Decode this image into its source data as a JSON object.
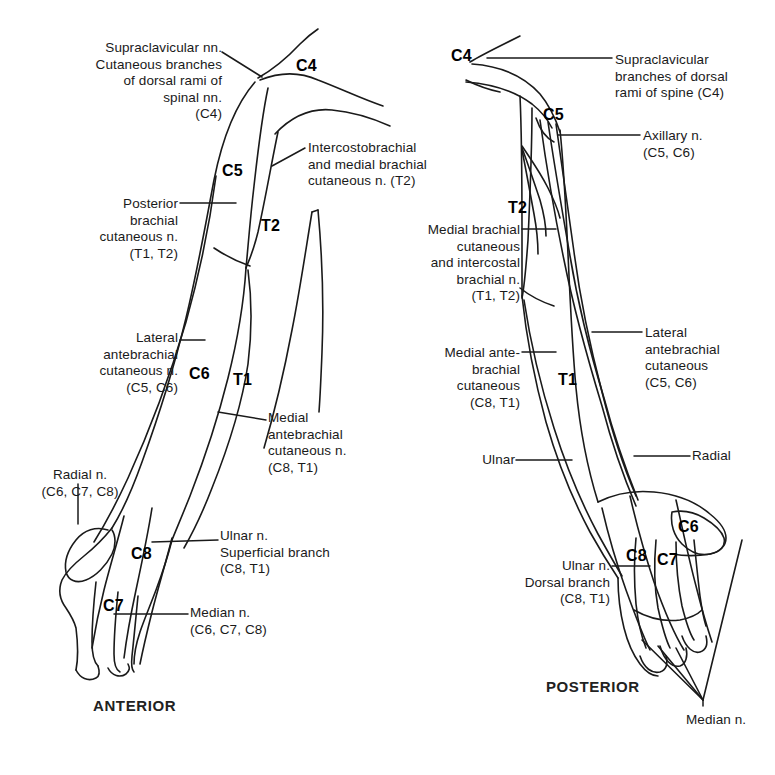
{
  "figure": {
    "background_color": "#ffffff",
    "line_color": "#1a1a1a",
    "text_color": "#1a1a1a"
  },
  "anterior": {
    "view_label": "ANTERIOR",
    "dermatomes": [
      {
        "name": "C4",
        "text": "C4",
        "x": 296,
        "y": 57
      },
      {
        "name": "C5",
        "text": "C5",
        "x": 222,
        "y": 162
      },
      {
        "name": "T2",
        "text": "T2",
        "x": 261,
        "y": 217
      },
      {
        "name": "C6",
        "text": "C6",
        "x": 189,
        "y": 365
      },
      {
        "name": "T1",
        "text": "T1",
        "x": 233,
        "y": 371
      },
      {
        "name": "C8",
        "text": "C8",
        "x": 131,
        "y": 545
      },
      {
        "name": "C7",
        "text": "C7",
        "x": 103,
        "y": 597
      }
    ],
    "labels": [
      {
        "name": "supraclavicular-nerves",
        "text": "Supraclavicular nn.\nCutaneous branches\nof dorsal rami of\nspinal nn.\n(C4)",
        "align": "right",
        "x": 52,
        "y": 40,
        "width": 170
      },
      {
        "name": "intercostobrachial-nerve",
        "text": "Intercostobrachial\nand medial brachial\ncutaneous n. (T2)",
        "align": "left",
        "x": 308,
        "y": 140,
        "width": 180
      },
      {
        "name": "posterior-brachial-cutaneous-nerve",
        "text": "Posterior\nbrachial\ncutaneous n.\n(T1, T2)",
        "align": "right",
        "x": 48,
        "y": 196,
        "width": 130
      },
      {
        "name": "lateral-antebrachial-cutaneous-nerve",
        "text": "Lateral\nantebrachial\ncutaneous n.\n(C5, C6)",
        "align": "right",
        "x": 48,
        "y": 330,
        "width": 130
      },
      {
        "name": "medial-antebrachial-cutaneous-nerve",
        "text": "Medial\nantebrachial\ncutaneous n.\n(C8, T1)",
        "align": "left",
        "x": 268,
        "y": 410,
        "width": 130
      },
      {
        "name": "radial-nerve",
        "text": "Radial n.\n(C6, C7, C8)",
        "align": "center",
        "x": 20,
        "y": 467,
        "width": 120
      },
      {
        "name": "ulnar-nerve-superficial-branch",
        "text": "Ulnar n.\nSuperficial branch\n(C8, T1)",
        "align": "left",
        "x": 220,
        "y": 528,
        "width": 150
      },
      {
        "name": "median-nerve",
        "text": "Median n.\n(C6, C7, C8)",
        "align": "left",
        "x": 190,
        "y": 605,
        "width": 130
      }
    ]
  },
  "posterior": {
    "view_label": "POSTERIOR",
    "dermatomes": [
      {
        "name": "C4",
        "text": "C4",
        "x": 451,
        "y": 47
      },
      {
        "name": "C5",
        "text": "C5",
        "x": 543,
        "y": 106
      },
      {
        "name": "T2",
        "text": "T2",
        "x": 508,
        "y": 199
      },
      {
        "name": "T1",
        "text": "T1",
        "x": 558,
        "y": 371
      },
      {
        "name": "C6",
        "text": "C6",
        "x": 678,
        "y": 518
      },
      {
        "name": "C8",
        "text": "C8",
        "x": 626,
        "y": 547
      },
      {
        "name": "C7",
        "text": "C7",
        "x": 657,
        "y": 551
      }
    ],
    "labels": [
      {
        "name": "supraclavicular-branches-dorsal-rami",
        "text": "Supraclavicular\nbranches of dorsal\nrami of spine (C4)",
        "align": "left",
        "x": 615,
        "y": 52,
        "width": 160
      },
      {
        "name": "axillary-nerve",
        "text": "Axillary n.\n(C5, C6)",
        "align": "left",
        "x": 643,
        "y": 128,
        "width": 110
      },
      {
        "name": "medial-brachial-cutaneous-intercostal",
        "text": "Medial brachial\ncutaneous\nand intercostal\nbrachial n.\n(T1, T2)",
        "align": "right",
        "x": 385,
        "y": 222,
        "width": 135
      },
      {
        "name": "medial-antebrachial-cutaneous",
        "text": "Medial ante-\nbrachial\ncutaneous\n(C8, T1)",
        "align": "right",
        "x": 400,
        "y": 345,
        "width": 120
      },
      {
        "name": "lateral-antebrachial-cutaneous",
        "text": "Lateral\nantebrachial\ncutaneous\n(C5, C6)",
        "align": "left",
        "x": 645,
        "y": 325,
        "width": 125
      },
      {
        "name": "ulnar",
        "text": "Ulnar",
        "align": "right",
        "x": 440,
        "y": 452,
        "width": 75
      },
      {
        "name": "radial",
        "text": "Radial",
        "align": "left",
        "x": 692,
        "y": 448,
        "width": 70
      },
      {
        "name": "ulnar-nerve-dorsal-branch",
        "text": "Ulnar n.\nDorsal branch\n(C8, T1)",
        "align": "right",
        "x": 490,
        "y": 558,
        "width": 120
      },
      {
        "name": "median-nerve",
        "text": "Median n.",
        "align": "left",
        "x": 686,
        "y": 712,
        "width": 90
      }
    ]
  }
}
